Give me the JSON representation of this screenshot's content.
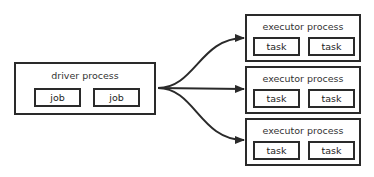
{
  "driver": {
    "title": "driver process",
    "jobs": [
      "job",
      "job"
    ]
  },
  "executors": [
    {
      "title": "executor process",
      "tasks": [
        "task",
        "task"
      ]
    },
    {
      "title": "executor process",
      "tasks": [
        "task",
        "task"
      ]
    },
    {
      "title": "executor process",
      "tasks": [
        "task",
        "task"
      ]
    }
  ],
  "colors": {
    "stroke": "#2a2a2a",
    "background": "#ffffff"
  }
}
